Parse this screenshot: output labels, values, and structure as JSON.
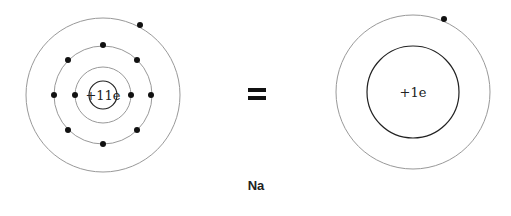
{
  "diagram": {
    "element": "Na",
    "equals_symbol": "=",
    "left_atom": {
      "nucleus_label": "+11e",
      "shells": [
        {
          "electrons": 2
        },
        {
          "electrons": 8
        },
        {
          "electrons": 1
        }
      ]
    },
    "right_atom": {
      "core_label": "+1e",
      "shells": [
        {
          "electrons": 1
        }
      ]
    },
    "colors": {
      "orbit": "#999999",
      "core_outline": "#222222",
      "electron": "#111111"
    }
  }
}
